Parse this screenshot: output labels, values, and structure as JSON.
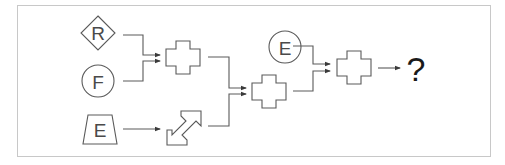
{
  "diagram": {
    "nodes": {
      "input_r": {
        "label": "R",
        "shape": "diamond"
      },
      "input_f": {
        "label": "F",
        "shape": "circle"
      },
      "input_e_trap": {
        "label": "E",
        "shape": "trapezoid"
      },
      "input_e_circle": {
        "label": "E",
        "shape": "circle"
      },
      "op_cross_1": {
        "label": "",
        "shape": "cross"
      },
      "op_double_arrow": {
        "label": "",
        "shape": "double-arrow"
      },
      "op_cross_2": {
        "label": "",
        "shape": "cross"
      },
      "op_cross_3": {
        "label": "",
        "shape": "cross"
      },
      "output": {
        "label": "?"
      }
    },
    "edges": [
      {
        "from": "input_r",
        "to": "op_cross_1"
      },
      {
        "from": "input_f",
        "to": "op_cross_1"
      },
      {
        "from": "input_e_trap",
        "to": "op_double_arrow"
      },
      {
        "from": "op_cross_1",
        "to": "op_cross_2"
      },
      {
        "from": "op_double_arrow",
        "to": "op_cross_2"
      },
      {
        "from": "input_e_circle",
        "to": "op_cross_3"
      },
      {
        "from": "op_cross_2",
        "to": "op_cross_3"
      },
      {
        "from": "op_cross_3",
        "to": "output"
      }
    ],
    "colors": {
      "stroke": "#5a5a5a",
      "frame": "#c8c8c8",
      "question": "#1a1a1a"
    }
  }
}
